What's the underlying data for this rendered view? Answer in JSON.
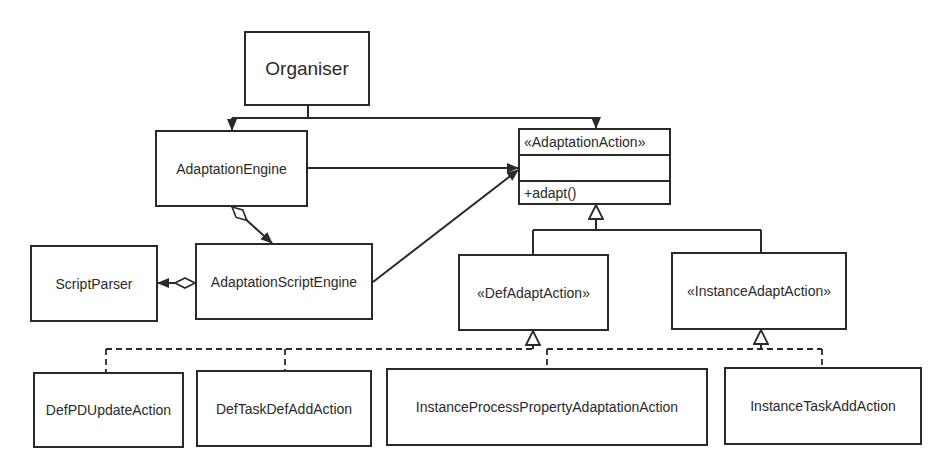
{
  "diagram": {
    "type": "UML class diagram",
    "classes": {
      "organiser": {
        "label": "Organiser"
      },
      "adaptation_engine": {
        "label": "AdaptationEngine"
      },
      "adaptation_action": {
        "stereotype": "«AdaptationAction»",
        "attributes": "",
        "operations": "+adapt()"
      },
      "script_parser": {
        "label": "ScriptParser"
      },
      "adaptation_script_engine": {
        "label": "AdaptationScriptEngine"
      },
      "def_adapt_action": {
        "label": "«DefAdaptAction»"
      },
      "instance_adapt_action": {
        "label": "«InstanceAdaptAction»"
      },
      "def_pd_update_action": {
        "label": "DefPDUpdateAction"
      },
      "def_task_def_add_action": {
        "label": "DefTaskDefAddAction"
      },
      "instance_process_property_adaptation_action": {
        "label": "InstanceProcessPropertyAdaptationAction"
      },
      "instance_task_add_action": {
        "label": "InstanceTaskAddAction"
      }
    },
    "relations": [
      {
        "from": "Organiser",
        "to": "AdaptationEngine",
        "kind": "association"
      },
      {
        "from": "Organiser",
        "to": "«AdaptationAction»",
        "kind": "association"
      },
      {
        "from": "AdaptationEngine",
        "to": "«AdaptationAction»",
        "kind": "association"
      },
      {
        "from": "AdaptationEngine",
        "to": "AdaptationScriptEngine",
        "kind": "aggregation"
      },
      {
        "from": "AdaptationScriptEngine",
        "to": "ScriptParser",
        "kind": "aggregation"
      },
      {
        "from": "AdaptationScriptEngine",
        "to": "«AdaptationAction»",
        "kind": "association"
      },
      {
        "from": "«DefAdaptAction»",
        "to": "«AdaptationAction»",
        "kind": "generalization"
      },
      {
        "from": "«InstanceAdaptAction»",
        "to": "«AdaptationAction»",
        "kind": "generalization"
      },
      {
        "from": "DefPDUpdateAction",
        "to": "«DefAdaptAction»",
        "kind": "realization"
      },
      {
        "from": "DefTaskDefAddAction",
        "to": "«DefAdaptAction»",
        "kind": "realization"
      },
      {
        "from": "InstanceProcessPropertyAdaptationAction",
        "to": "«InstanceAdaptAction»",
        "kind": "realization"
      },
      {
        "from": "InstanceTaskAddAction",
        "to": "«InstanceAdaptAction»",
        "kind": "realization"
      }
    ],
    "colors": {
      "stroke": "#2a2a2a",
      "background": "#ffffff"
    }
  }
}
